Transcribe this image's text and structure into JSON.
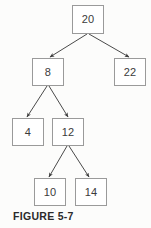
{
  "figure": {
    "caption": "FIGURE 5-7",
    "background_color": "#fcfcfb",
    "node_fill_color": "#ffffff",
    "node_border_color": "#9a9a9a",
    "edge_color": "#4a4a4a",
    "text_color": "#3b3b3b"
  },
  "chart_data": {
    "type": "diagram",
    "diagram_type": "binary-search-tree",
    "title": "FIGURE 5-7",
    "nodes": [
      {
        "id": "n20",
        "label": "20",
        "x": 72,
        "y": 5,
        "w": 32,
        "h": 29,
        "level": 0
      },
      {
        "id": "n8",
        "label": "8",
        "x": 32,
        "y": 58,
        "w": 32,
        "h": 28,
        "level": 1
      },
      {
        "id": "n22",
        "label": "22",
        "x": 114,
        "y": 58,
        "w": 32,
        "h": 28,
        "level": 1
      },
      {
        "id": "n4",
        "label": "4",
        "x": 12,
        "y": 118,
        "w": 32,
        "h": 28,
        "level": 2
      },
      {
        "id": "n12",
        "label": "12",
        "x": 52,
        "y": 118,
        "w": 32,
        "h": 28,
        "level": 2
      },
      {
        "id": "n10",
        "label": "10",
        "x": 34,
        "y": 178,
        "w": 32,
        "h": 28,
        "level": 3
      },
      {
        "id": "n14",
        "label": "14",
        "x": 75,
        "y": 178,
        "w": 32,
        "h": 28,
        "level": 3
      }
    ],
    "edges": [
      {
        "from": "n20",
        "to": "n8",
        "x1": 87,
        "y1": 34,
        "x2": 50,
        "y2": 57,
        "arrow": true
      },
      {
        "from": "n20",
        "to": "n22",
        "x1": 89,
        "y1": 34,
        "x2": 129,
        "y2": 57,
        "arrow": true
      },
      {
        "from": "n8",
        "to": "n4",
        "x1": 47,
        "y1": 86,
        "x2": 27,
        "y2": 117,
        "arrow": true
      },
      {
        "from": "n8",
        "to": "n12",
        "x1": 49,
        "y1": 86,
        "x2": 68,
        "y2": 117,
        "arrow": true
      },
      {
        "from": "n12",
        "to": "n10",
        "x1": 67,
        "y1": 146,
        "x2": 49,
        "y2": 177,
        "arrow": true
      },
      {
        "from": "n12",
        "to": "n14",
        "x1": 69,
        "y1": 146,
        "x2": 89,
        "y2": 177,
        "arrow": true
      }
    ]
  }
}
